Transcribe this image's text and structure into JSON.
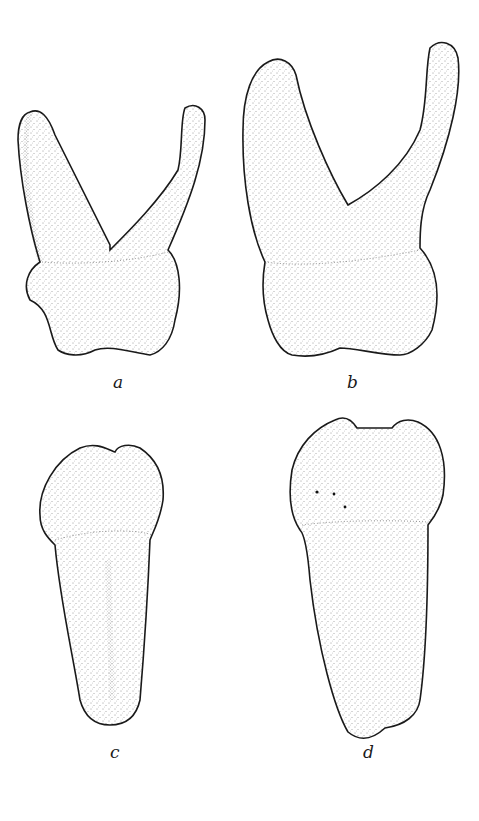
{
  "figure": {
    "panels": [
      {
        "label": "a",
        "view": "tooth with two divergent roots, crown below"
      },
      {
        "label": "b",
        "view": "larger tooth with two divergent roots, right root curved"
      },
      {
        "label": "c",
        "view": "single-rooted tooth, crown above"
      },
      {
        "label": "d",
        "view": "larger single-rooted tooth, crown above"
      }
    ],
    "colors": {
      "ink": "#1a1a1a",
      "paper": "#ffffff"
    }
  }
}
